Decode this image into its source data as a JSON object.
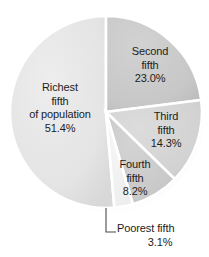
{
  "chart_data": {
    "type": "pie",
    "title": "",
    "subtitle": "",
    "xlabel": "",
    "ylabel": "",
    "legend_position": "none",
    "grid": false,
    "units": "percent",
    "start_angle_deg": 0,
    "direction": "clockwise",
    "categories": [
      "Second fifth",
      "Third fifth",
      "Fourth fifth",
      "Poorest fifth",
      "Richest fifth of population"
    ],
    "values": [
      23.0,
      14.3,
      8.2,
      3.1,
      51.4
    ],
    "slices": [
      {
        "key": "second",
        "name": "Second fifth",
        "name_lines": [
          "Second",
          "fifth"
        ],
        "value": 23.0,
        "value_label": "23.0%",
        "color": "#c9c9c9",
        "start_deg": 0.0,
        "end_deg": 82.8,
        "label_placement": "inside"
      },
      {
        "key": "third",
        "name": "Third fifth",
        "name_lines": [
          "Third",
          "fifth"
        ],
        "value": 14.3,
        "value_label": "14.3%",
        "color": "#d5d5d5",
        "start_deg": 82.8,
        "end_deg": 134.3,
        "label_placement": "inside"
      },
      {
        "key": "fourth",
        "name": "Fourth fifth",
        "name_lines": [
          "Fourth",
          "fifth"
        ],
        "value": 8.2,
        "value_label": "8.2%",
        "color": "#cccccc",
        "start_deg": 134.3,
        "end_deg": 163.8,
        "label_placement": "inside"
      },
      {
        "key": "poorest",
        "name": "Poorest fifth",
        "name_lines": [
          "Poorest fifth"
        ],
        "value": 3.1,
        "value_label": "3.1%",
        "color": "#f2f2f2",
        "start_deg": 163.8,
        "end_deg": 175.0,
        "label_placement": "callout"
      },
      {
        "key": "richest",
        "name": "Richest fifth of population",
        "name_lines": [
          "Richest",
          "fifth",
          "of population"
        ],
        "value": 51.4,
        "value_label": "51.4%",
        "color": "#e3e3e3",
        "start_deg": 175.0,
        "end_deg": 360.0,
        "label_placement": "inside"
      }
    ],
    "colors": {
      "background": "#ffffff",
      "slice_divider": "#ffffff",
      "text": "#1c1c1c",
      "leader_line": "#4a4a4a",
      "shadow": "#d9d9d9"
    }
  },
  "labels": {
    "richest": {
      "line1": "Richest",
      "line2": "fifth",
      "line3": "of population",
      "pct": "51.4%"
    },
    "second": {
      "line1": "Second",
      "line2": "fifth",
      "pct": "23.0%"
    },
    "third": {
      "line1": "Third",
      "line2": "fifth",
      "pct": "14.3%"
    },
    "fourth": {
      "line1": "Fourth",
      "line2": "fifth",
      "pct": "8.2%"
    },
    "poorest": {
      "line1": "Poorest fifth",
      "pct": "3.1%"
    }
  }
}
